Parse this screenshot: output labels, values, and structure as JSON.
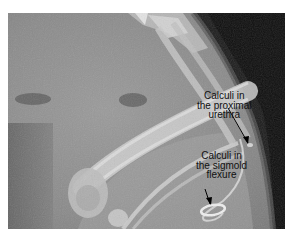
{
  "figure": {
    "annotations": [
      {
        "id": "proximal-urethra",
        "lines": [
          "Calculi in",
          "the proximal",
          "urethra"
        ]
      },
      {
        "id": "sigmoid-flexure",
        "lines": [
          "Calculi in",
          "the sigmold",
          "flexure"
        ]
      }
    ]
  }
}
